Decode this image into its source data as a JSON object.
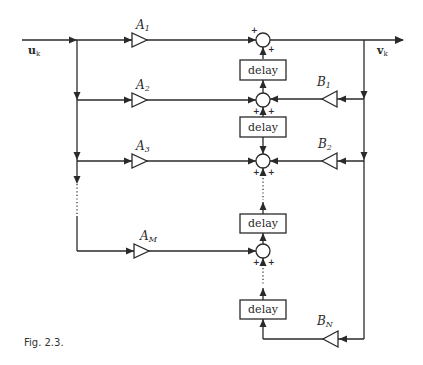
{
  "diagram": {
    "type": "block-diagram",
    "input_signal": {
      "base": "u",
      "sub": "k"
    },
    "output_signal": {
      "base": "v",
      "sub": "k"
    },
    "feedforward_gains": [
      {
        "base": "A",
        "sub": "1"
      },
      {
        "base": "A",
        "sub": "2"
      },
      {
        "base": "A",
        "sub": "3"
      },
      {
        "base": "A",
        "sub": "M"
      }
    ],
    "feedback_gains": [
      {
        "base": "B",
        "sub": "1"
      },
      {
        "base": "B",
        "sub": "2"
      },
      {
        "base": "B",
        "sub": "N"
      }
    ],
    "delay_label": "delay",
    "delay_blocks": [
      "delay",
      "delay",
      "delay",
      "delay"
    ],
    "sum_signs": "+",
    "caption": "Fig. 2.3."
  }
}
